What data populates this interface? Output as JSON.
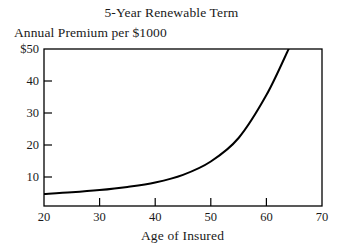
{
  "chart_data": {
    "type": "line",
    "title": "5-Year Renewable Term",
    "xlabel": "Age of Insured",
    "ylabel": "Annual Premium per $1000",
    "xlim": [
      20,
      70
    ],
    "ylim": [
      0.6,
      50
    ],
    "xticks": [
      20,
      30,
      40,
      50,
      60,
      70
    ],
    "xtick_labels": [
      "20",
      "30",
      "40",
      "50",
      "60",
      "70"
    ],
    "yticks": [
      10,
      20,
      30,
      40,
      50
    ],
    "ytick_labels": [
      "10",
      "20",
      "30",
      "40",
      "$50"
    ],
    "grid": false,
    "legend": false,
    "series": [
      {
        "name": "Annual Premium per $1000",
        "x": [
          20,
          25,
          30,
          35,
          40,
          45,
          50,
          55,
          60,
          64
        ],
        "values": [
          4.4,
          4.9,
          5.6,
          6.6,
          8.0,
          10.4,
          14.6,
          22.0,
          35.5,
          50.0
        ]
      }
    ],
    "line_color": "#000000",
    "line_width": 2.0
  }
}
